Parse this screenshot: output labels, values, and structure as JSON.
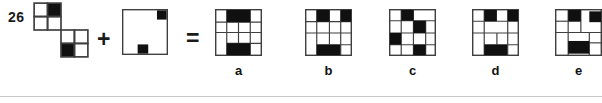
{
  "problem_number": "26",
  "operator_plus": "+",
  "operator_equals": "=",
  "colors": {
    "background": "#ffffff",
    "line": "#3f3f3f",
    "black": "#101010",
    "divider": "#c9c9c9"
  },
  "equation": {
    "figure1": {
      "grids": [
        {
          "x": 2,
          "y": 2,
          "cell": 24,
          "rows": 2,
          "cols": 2,
          "black_cells": [
            [
              0,
              1
            ]
          ]
        },
        {
          "x": 50,
          "y": 50,
          "cell": 24,
          "rows": 2,
          "cols": 2,
          "black_cells": [
            [
              1,
              0
            ]
          ]
        }
      ]
    },
    "figure2": {
      "border": true,
      "blacks": [
        {
          "x": 76,
          "y": 3,
          "w": 21,
          "h": 20
        },
        {
          "x": 34,
          "y": 77,
          "w": 23,
          "h": 20
        }
      ]
    }
  },
  "options": [
    {
      "label": "a",
      "figure": {
        "border": true,
        "blacks": [
          {
            "x": 25,
            "y": 2,
            "w": 50,
            "h": 26
          },
          {
            "x": 25,
            "y": 73,
            "w": 50,
            "h": 25
          }
        ],
        "vlines": [
          {
            "x": 25,
            "y1": 0,
            "y2": 100
          },
          {
            "x": 50,
            "y1": 28,
            "y2": 73
          },
          {
            "x": 75,
            "y1": 0,
            "y2": 100
          }
        ],
        "hlines": [
          {
            "y": 28,
            "x1": 0,
            "x2": 100
          },
          {
            "y": 50,
            "x1": 0,
            "x2": 100
          },
          {
            "y": 73,
            "x1": 25,
            "x2": 100
          }
        ]
      }
    },
    {
      "label": "b",
      "figure": {
        "border": true,
        "blacks": [
          {
            "x": 25,
            "y": 2,
            "w": 27,
            "h": 25
          },
          {
            "x": 76,
            "y": 2,
            "w": 22,
            "h": 25
          },
          {
            "x": 25,
            "y": 76,
            "w": 50,
            "h": 22
          }
        ],
        "vlines": [
          {
            "x": 25,
            "y1": 0,
            "y2": 100
          },
          {
            "x": 52,
            "y1": 0,
            "y2": 76
          },
          {
            "x": 76,
            "y1": 0,
            "y2": 100
          }
        ],
        "hlines": [
          {
            "y": 27,
            "x1": 0,
            "x2": 100
          },
          {
            "y": 51,
            "x1": 0,
            "x2": 100
          },
          {
            "y": 76,
            "x1": 25,
            "x2": 100
          }
        ]
      }
    },
    {
      "label": "c",
      "figure": {
        "border": true,
        "blacks": [
          {
            "x": 26,
            "y": 2,
            "w": 26,
            "h": 23
          },
          {
            "x": 52,
            "y": 25,
            "w": 26,
            "h": 26
          },
          {
            "x": 2,
            "y": 51,
            "w": 24,
            "h": 25
          },
          {
            "x": 52,
            "y": 76,
            "w": 26,
            "h": 22
          }
        ],
        "vlines": [
          {
            "x": 26,
            "y1": 0,
            "y2": 100
          },
          {
            "x": 52,
            "y1": 0,
            "y2": 100
          },
          {
            "x": 78,
            "y1": 25,
            "y2": 100
          }
        ],
        "hlines": [
          {
            "y": 25,
            "x1": 0,
            "x2": 100
          },
          {
            "y": 51,
            "x1": 0,
            "x2": 100
          },
          {
            "y": 76,
            "x1": 0,
            "x2": 100
          }
        ]
      }
    },
    {
      "label": "d",
      "figure": {
        "border": true,
        "blacks": [
          {
            "x": 26,
            "y": 2,
            "w": 27,
            "h": 24
          },
          {
            "x": 76,
            "y": 2,
            "w": 22,
            "h": 24
          },
          {
            "x": 26,
            "y": 76,
            "w": 49,
            "h": 22
          }
        ],
        "vlines": [
          {
            "x": 26,
            "y1": 0,
            "y2": 100
          },
          {
            "x": 53,
            "y1": 51,
            "y2": 76
          },
          {
            "x": 76,
            "y1": 0,
            "y2": 100
          }
        ],
        "hlines": [
          {
            "y": 26,
            "x1": 0,
            "x2": 100
          },
          {
            "y": 51,
            "x1": 0,
            "x2": 100
          },
          {
            "y": 76,
            "x1": 26,
            "x2": 100
          }
        ]
      }
    },
    {
      "label": "e",
      "figure": {
        "border": true,
        "blacks": [
          {
            "x": 28,
            "y": 2,
            "w": 27,
            "h": 24
          },
          {
            "x": 73,
            "y": 5,
            "w": 25,
            "h": 23
          },
          {
            "x": 28,
            "y": 68,
            "w": 45,
            "h": 27
          }
        ],
        "vlines": [
          {
            "x": 28,
            "y1": 0,
            "y2": 100
          },
          {
            "x": 55,
            "y1": 0,
            "y2": 50
          },
          {
            "x": 73,
            "y1": 50,
            "y2": 100
          }
        ],
        "hlines": [
          {
            "y": 26,
            "x1": 0,
            "x2": 55
          },
          {
            "y": 50,
            "x1": 0,
            "x2": 100
          },
          {
            "y": 72,
            "x1": 73,
            "x2": 100
          }
        ]
      }
    }
  ]
}
